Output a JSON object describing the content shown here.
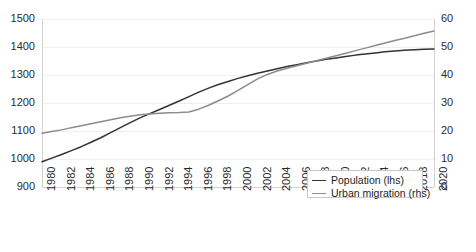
{
  "chart_data": {
    "type": "line",
    "title": "",
    "xlabel": "",
    "ylabel": "",
    "grid": true,
    "legend_position": "bottom-right",
    "x": [
      1980,
      1981,
      1982,
      1983,
      1984,
      1985,
      1986,
      1987,
      1988,
      1989,
      1990,
      1991,
      1992,
      1993,
      1994,
      1995,
      1996,
      1997,
      1998,
      1999,
      2000,
      2001,
      2002,
      2003,
      2004,
      2005,
      2006,
      2007,
      2008,
      2009,
      2010,
      2011,
      2012,
      2013,
      2014,
      2015,
      2016,
      2017,
      2018,
      2019,
      2020
    ],
    "xtick_labels": [
      "1980",
      "1982",
      "1984",
      "1986",
      "1988",
      "1990",
      "1992",
      "1994",
      "1996",
      "1998",
      "2000",
      "2002",
      "2004",
      "2006",
      "2008",
      "2010",
      "2012",
      "2014",
      "2016",
      "2018",
      "2020"
    ],
    "xlim": [
      1980,
      2020
    ],
    "axes": [
      {
        "id": "lhs",
        "side": "left",
        "ylim": [
          900,
          1500
        ],
        "ytick_labels": [
          "1500",
          "1400",
          "1300",
          "1200",
          "1100",
          "1000",
          "900"
        ],
        "yticks": [
          1500,
          1400,
          1300,
          1200,
          1100,
          1000,
          900
        ]
      },
      {
        "id": "rhs",
        "side": "right",
        "ylim": [
          0,
          60
        ],
        "ytick_labels": [
          "60",
          "50",
          "40",
          "30",
          "20",
          "10",
          "0"
        ],
        "yticks": [
          60,
          50,
          40,
          30,
          20,
          10,
          0
        ]
      }
    ],
    "series": [
      {
        "name": "Population (lhs)",
        "axis": "lhs",
        "color": "#333333",
        "values": [
          990,
          1003,
          1016,
          1030,
          1044,
          1060,
          1076,
          1094,
          1112,
          1130,
          1147,
          1162,
          1177,
          1192,
          1207,
          1223,
          1239,
          1253,
          1266,
          1277,
          1288,
          1297,
          1306,
          1314,
          1322,
          1330,
          1337,
          1344,
          1350,
          1356,
          1361,
          1366,
          1371,
          1375,
          1379,
          1383,
          1386,
          1388,
          1390,
          1392,
          1393
        ]
      },
      {
        "name": "Urban migration (rhs)",
        "axis": "rhs",
        "color": "#8c8c8c",
        "values": [
          19.2,
          19.8,
          20.4,
          21.2,
          21.9,
          22.6,
          23.3,
          24.0,
          24.7,
          25.3,
          25.8,
          26.1,
          26.3,
          26.5,
          26.6,
          26.8,
          27.8,
          29.2,
          30.8,
          32.5,
          34.5,
          36.6,
          38.6,
          40.2,
          41.4,
          42.4,
          43.3,
          44.2,
          45.1,
          46.0,
          46.9,
          47.8,
          48.7,
          49.6,
          50.5,
          51.4,
          52.3,
          53.1,
          54.0,
          54.9,
          55.7
        ]
      }
    ]
  },
  "legend": {
    "items": [
      {
        "label": "Population (lhs)",
        "color": "#333333"
      },
      {
        "label": "Urban migration (rhs)",
        "color": "#8c8c8c"
      }
    ]
  }
}
